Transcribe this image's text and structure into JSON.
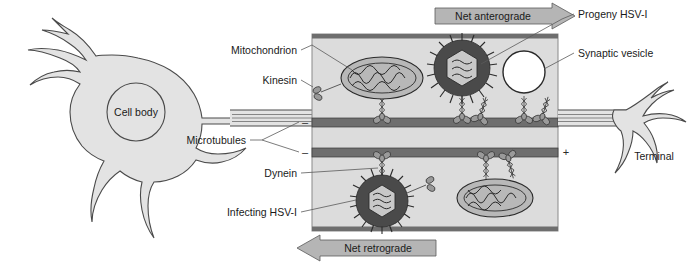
{
  "figure": {
    "neuron": {
      "cell_body_label": "Cell body",
      "terminal_label": "Terminal"
    },
    "labels": {
      "mitochondrion": "Mitochondrion",
      "kinesin": "Kinesin",
      "microtubules": "Microtubules",
      "dynein": "Dynein",
      "infecting_hsv": "Infecting HSV-I",
      "progeny_hsv": "Progeny HSV-I",
      "synaptic_vesicle": "Synaptic vesicle"
    },
    "banners": {
      "anterograde": "Net anterograde",
      "retrograde": "Net retrograde"
    },
    "polarity": {
      "minus": "–",
      "plus": "+",
      "upper_left": "–",
      "upper_right": "+",
      "lower_left": "–",
      "lower_right": "+"
    },
    "colors": {
      "background": "#ffffff",
      "cell_fill": "#e3e3e3",
      "panel_fill": "#dcdcdc",
      "microtubule": "#6e6e6e",
      "motor": "#9a9a9a",
      "mitochondrion": "#b8b8b8",
      "vesicle": "#ffffff",
      "virion_envelope": "#4a4a4a",
      "banner": "#b5b5b5",
      "outline": "#2a2a2a"
    },
    "cargo": {
      "upper_track": [
        "mitochondrion",
        "progeny-hsv-virion",
        "synaptic-vesicle"
      ],
      "lower_track": [
        "infecting-hsv-virion",
        "mitochondrion"
      ]
    }
  }
}
